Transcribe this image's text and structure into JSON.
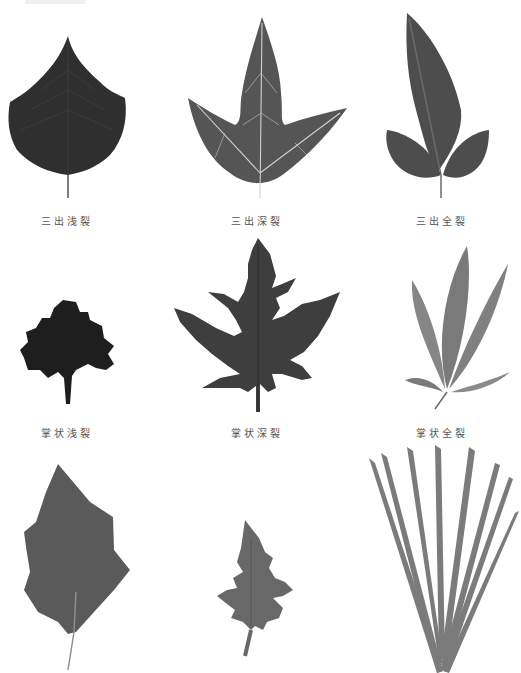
{
  "figure": {
    "topic": "leaf lobing types",
    "colors": {
      "background": "#ffffff",
      "caption": "#555555",
      "vein": "#d8d8d8"
    },
    "rows": [
      {
        "items": [
          {
            "id": "trifid-shallow",
            "label": "三出浅裂",
            "fill": "#2f2f2f"
          },
          {
            "id": "trifid-deep",
            "label": "三出深裂",
            "fill": "#555555"
          },
          {
            "id": "trifid-full",
            "label": "三出全裂",
            "fill": "#4d4d4d"
          }
        ]
      },
      {
        "items": [
          {
            "id": "palmate-shallow",
            "label": "掌状浅裂",
            "fill": "#1e1e1e"
          },
          {
            "id": "palmate-deep",
            "label": "掌状深裂",
            "fill": "#3e3e3e"
          },
          {
            "id": "palmate-full",
            "label": "掌状全裂",
            "fill": "#7a7a7a"
          }
        ]
      },
      {
        "items": [
          {
            "id": "pinnate-shallow",
            "label": "",
            "fill": "#5a5a5a"
          },
          {
            "id": "pinnate-deep",
            "label": "",
            "fill": "#686868"
          },
          {
            "id": "pinnate-full",
            "label": "",
            "fill": "#7b7b7b"
          }
        ]
      }
    ]
  }
}
